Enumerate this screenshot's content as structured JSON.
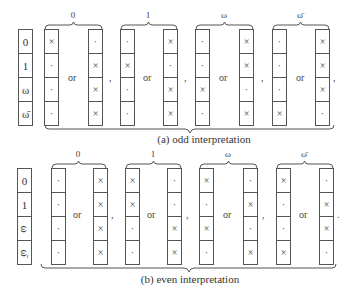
{
  "panels": [
    {
      "id": "odd",
      "caption": "(a) odd interpretation",
      "row_labels": [
        "0",
        "1",
        "ω",
        "ω̄"
      ],
      "row_labels_rotated": false,
      "groups": [
        {
          "label": "0",
          "left": [
            "×",
            "·",
            "·",
            "·"
          ],
          "right": [
            "·",
            "×",
            "×",
            "×"
          ],
          "or": "or",
          "separator": ","
        },
        {
          "label": "1",
          "left": [
            "·",
            "×",
            "·",
            "·"
          ],
          "right": [
            "×",
            "·",
            "×",
            "×"
          ],
          "or": "or",
          "separator": ","
        },
        {
          "label": "ω",
          "left": [
            "·",
            "·",
            "×",
            "·"
          ],
          "right": [
            "×",
            "×",
            "·",
            "×"
          ],
          "or": "or",
          "separator": ","
        },
        {
          "label": "ω̄",
          "left": [
            "·",
            "·",
            "·",
            "×"
          ],
          "right": [
            "×",
            "×",
            "×",
            "·"
          ],
          "or": "or",
          "separator": ","
        }
      ]
    },
    {
      "id": "even",
      "caption": "(b) even interpretation",
      "row_labels": [
        "0",
        "1",
        "ω",
        "ω̄"
      ],
      "row_labels_rotated": true,
      "groups": [
        {
          "label": "0",
          "left": [
            "·",
            "·",
            "·",
            "·"
          ],
          "right": [
            "×",
            "×",
            "×",
            "×"
          ],
          "or": "or",
          "separator": ","
        },
        {
          "label": "1",
          "left": [
            "×",
            "×",
            "·",
            "·"
          ],
          "right": [
            "·",
            "·",
            "×",
            "×"
          ],
          "or": "or",
          "separator": ","
        },
        {
          "label": "ω",
          "left": [
            "×",
            "·",
            "×",
            "·"
          ],
          "right": [
            "·",
            "×",
            "·",
            "×"
          ],
          "or": "or",
          "separator": ","
        },
        {
          "label": "ω̄",
          "left": [
            "×",
            "·",
            "·",
            "×"
          ],
          "right": [
            "·",
            "×",
            "×",
            "·"
          ],
          "or": "or",
          "separator": "."
        }
      ]
    }
  ]
}
